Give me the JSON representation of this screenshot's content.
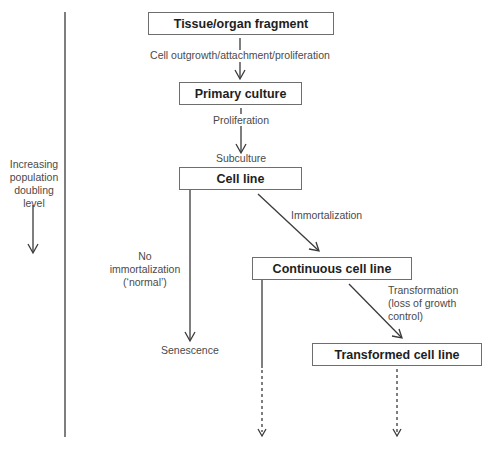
{
  "diagram": {
    "side_axis": {
      "label_lines": [
        "Increasing",
        "population",
        "doubling",
        "level"
      ],
      "direction": "down"
    },
    "nodes": {
      "tissue": "Tissue/organ fragment",
      "primary": "Primary culture",
      "cell_line": "Cell line",
      "continuous": "Continuous cell line",
      "transformed": "Transformed cell line"
    },
    "edges": {
      "tissue_to_primary": "Cell outgrowth/attachment/proliferation",
      "primary_proliferation": "Proliferation",
      "subculture": "Subculture",
      "immortalization": "Immortalization",
      "no_immortalization": [
        "No",
        "immortalization",
        "(‘normal’)"
      ],
      "senescence": "Senescence",
      "transformation": [
        "Transformation",
        "(loss of growth",
        "control)"
      ]
    },
    "colors": {
      "line": "#3a3a3a",
      "box_border": "#6e6e6e",
      "text": "#2a2a2a"
    }
  }
}
